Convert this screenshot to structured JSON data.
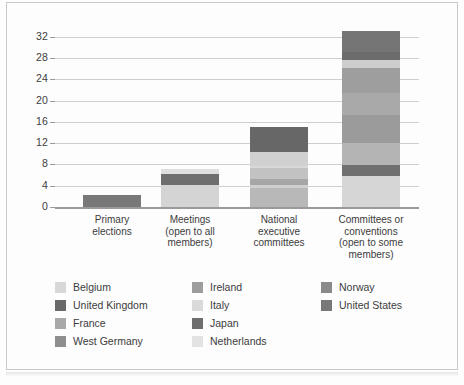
{
  "chart_data": {
    "type": "bar",
    "stacked": true,
    "title": "",
    "xlabel": "",
    "ylabel": "Number of parties",
    "ylim": [
      0,
      34
    ],
    "yticks": [
      0,
      4,
      8,
      12,
      16,
      20,
      24,
      28,
      32
    ],
    "ytick_labels": [
      "0",
      "4",
      "8",
      "12",
      "16",
      "20",
      "24",
      "28",
      "32"
    ],
    "grid": "horizontal",
    "legend_position": "bottom",
    "categories": [
      "Primary\nelections",
      "Meetings\n(open to all\nmembers)",
      "National\nexecutive\ncommittees",
      "Committees or\nconventions\n(open to some\nmembers)"
    ],
    "category_totals": [
      2.3,
      7.2,
      15.1,
      33.0
    ],
    "series": [
      {
        "name": "Belgium",
        "color": "#d8d8d8",
        "values": [
          0,
          0,
          0,
          5.9
        ]
      },
      {
        "name": "United Kingdom",
        "color": "#6a6a6a",
        "values": [
          0,
          0,
          0,
          1.6
        ]
      },
      {
        "name": "France",
        "color": "#a8a8a8",
        "values": [
          0,
          0,
          2.0,
          4.6
        ]
      },
      {
        "name": "West Germany",
        "color": "#8e8e8e",
        "values": [
          0,
          0,
          2.1,
          4.2
        ]
      },
      {
        "name": "Ireland",
        "color": "#9d9d9d",
        "values": [
          0,
          0,
          1.1,
          5.2
        ]
      },
      {
        "name": "Italy",
        "color": "#dadada",
        "values": [
          0,
          4.1,
          3.6,
          4.2
        ]
      },
      {
        "name": "Japan",
        "color": "#6e6e6e",
        "values": [
          0,
          2.1,
          0,
          2.0
        ]
      },
      {
        "name": "Netherlands",
        "color": "#e3e3e3",
        "values": [
          0,
          1.0,
          0.5,
          1.5
        ]
      },
      {
        "name": "Norway",
        "color": "#8a8a8a",
        "values": [
          0,
          0,
          0.5,
          0
        ]
      },
      {
        "name": "United States",
        "color": "#787878",
        "values": [
          2.3,
          0,
          5.3,
          3.8
        ]
      }
    ],
    "bar_segments": [
      {
        "category_index": 0,
        "segments": [
          {
            "series": "United States",
            "value": 2.3,
            "color": "#787878"
          }
        ]
      },
      {
        "category_index": 1,
        "segments": [
          {
            "series": "Italy",
            "value": 4.1,
            "color": "#d4d4d4"
          },
          {
            "series": "Japan",
            "value": 2.1,
            "color": "#6e6e6e"
          },
          {
            "series": "Netherlands",
            "value": 1.0,
            "color": "#dedede"
          }
        ]
      },
      {
        "category_index": 2,
        "segments": [
          {
            "series": "Italy",
            "value": 3.6,
            "color": "#b8b8b8"
          },
          {
            "series": "Norway",
            "value": 0.5,
            "color": "#cfcfcf"
          },
          {
            "series": "Ireland",
            "value": 1.1,
            "color": "#a6a6a6"
          },
          {
            "series": "West Germany",
            "value": 2.1,
            "color": "#c2c2c2"
          },
          {
            "series": "Netherlands",
            "value": 0.5,
            "color": "#d9d9d9"
          },
          {
            "series": "United States",
            "value": 2.5,
            "color": "#d0d0d0"
          },
          {
            "series": "France",
            "value": 4.8,
            "color": "#676767"
          }
        ]
      },
      {
        "category_index": 3,
        "segments": [
          {
            "series": "Belgium",
            "value": 5.9,
            "color": "#d6d6d6"
          },
          {
            "series": "Japan",
            "value": 2.0,
            "color": "#707070"
          },
          {
            "series": "Italy",
            "value": 4.2,
            "color": "#b4b4b4"
          },
          {
            "series": "Ireland",
            "value": 5.2,
            "color": "#9b9b9b"
          },
          {
            "series": "West Germany",
            "value": 4.2,
            "color": "#a9a9a9"
          },
          {
            "series": "France",
            "value": 4.6,
            "color": "#9e9e9e"
          },
          {
            "series": "Netherlands",
            "value": 1.5,
            "color": "#cdcdcd"
          },
          {
            "series": "United Kingdom",
            "value": 1.6,
            "color": "#6c6c6c"
          },
          {
            "series": "United States",
            "value": 3.8,
            "color": "#757575"
          }
        ]
      }
    ],
    "legend_columns": [
      [
        {
          "label": "Belgium",
          "color": "#d8d8d8"
        },
        {
          "label": "United Kingdom",
          "color": "#6a6a6a"
        },
        {
          "label": "France",
          "color": "#a8a8a8"
        },
        {
          "label": "West Germany",
          "color": "#8e8e8e"
        }
      ],
      [
        {
          "label": "Ireland",
          "color": "#9d9d9d"
        },
        {
          "label": "Italy",
          "color": "#dadada"
        },
        {
          "label": "Japan",
          "color": "#6e6e6e"
        },
        {
          "label": "Netherlands",
          "color": "#e3e3e3"
        }
      ],
      [
        {
          "label": "Norway",
          "color": "#8a8a8a"
        },
        {
          "label": "United States",
          "color": "#787878"
        }
      ]
    ]
  }
}
